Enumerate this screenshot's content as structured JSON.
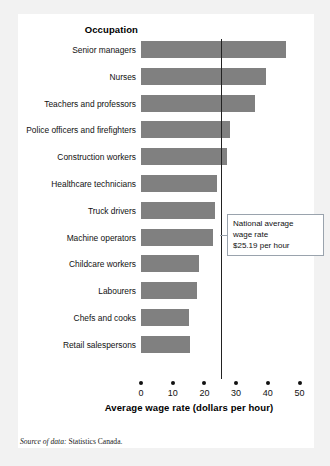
{
  "card": {
    "background": "#ffffff",
    "page_background": "#f2f2f2"
  },
  "axis_title_y": "Occupation",
  "x_axis_title": "Average wage rate (dollars per hour)",
  "callout": {
    "line1": "National average",
    "line2": "wage rate",
    "line3": "$25.19 per hour"
  },
  "source": {
    "label": "Source of data:",
    "value": " Statistics Canada."
  },
  "colors": {
    "bar": "#808080",
    "axis": "#111111",
    "callout_border": "#9aa3ad"
  },
  "chart_data": {
    "type": "bar",
    "orientation": "horizontal",
    "title": "",
    "xlabel": "Average wage rate (dollars per hour)",
    "ylabel": "Occupation",
    "xlim": [
      0,
      50
    ],
    "xticks": [
      0,
      10,
      20,
      30,
      40,
      50
    ],
    "xtick_labels": [
      "0",
      "10",
      "20",
      "30",
      "40",
      "50"
    ],
    "grid": false,
    "legend": false,
    "categories": [
      "Senior managers",
      "Nurses",
      "Teachers and professors",
      "Police officers and firefighters",
      "Construction workers",
      "Healthcare technicians",
      "Truck drivers",
      "Machine operators",
      "Childcare workers",
      "Labourers",
      "Chefs and cooks",
      "Retail salespersons"
    ],
    "values": [
      45.6,
      39.4,
      36.0,
      28.1,
      27.0,
      24.1,
      23.3,
      22.8,
      18.4,
      17.6,
      15.0,
      15.5
    ],
    "annotations": [
      {
        "type": "vline",
        "value": 25.19,
        "text": "National average wage rate $25.19 per hour"
      }
    ],
    "source": "Source of data: Statistics Canada."
  }
}
